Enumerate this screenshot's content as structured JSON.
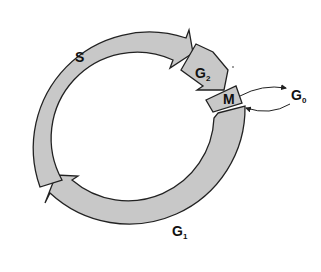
{
  "diagram": {
    "phases": [
      {
        "id": "S",
        "label": "S",
        "sub": ""
      },
      {
        "id": "G2",
        "label": "G",
        "sub": "2"
      },
      {
        "id": "M",
        "label": "M",
        "sub": ""
      },
      {
        "id": "G1",
        "label": "G",
        "sub": "1"
      }
    ],
    "exit": {
      "label": "G",
      "sub": "0"
    },
    "colors": {
      "fill": "#c8c8c8",
      "stroke": "#222222"
    }
  }
}
